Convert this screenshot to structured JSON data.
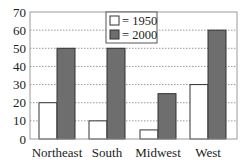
{
  "chart_data": {
    "type": "bar",
    "title": "",
    "xlabel": "",
    "ylabel": "",
    "categories": [
      "Northeast",
      "South",
      "Midwest",
      "West"
    ],
    "series": [
      {
        "name": "1950",
        "legend_label": "= 1950",
        "values": [
          20,
          10,
          5,
          30
        ],
        "color": "#ffffff"
      },
      {
        "name": "2000",
        "legend_label": "= 2000",
        "values": [
          50,
          50,
          25,
          60
        ],
        "color": "#6e6e6e"
      }
    ],
    "ylim": [
      0,
      70
    ],
    "yticks": [
      0,
      10,
      20,
      30,
      40,
      50,
      60,
      70
    ],
    "grid": "horizontal dotted",
    "legend_position": "top-center inside plot"
  },
  "colors": {
    "frame": "#9a9a9a",
    "grid": "#9a9a9a",
    "bar_outline": "#333333",
    "series_1950": "#ffffff",
    "series_2000": "#6e6e6e"
  }
}
